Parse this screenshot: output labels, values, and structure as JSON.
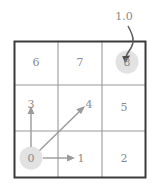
{
  "figure": {
    "type": "gridworld-policy-diagram",
    "grid": {
      "rows": 3,
      "cols": 3,
      "border_color": "#3a3a3a",
      "line_color": "#9a9a9a",
      "text_color": "#8a8a8a"
    },
    "cells": [
      {
        "id": "cell-6",
        "label": "6",
        "row": 0,
        "col": 0,
        "highlight": false
      },
      {
        "id": "cell-7",
        "label": "7",
        "row": 0,
        "col": 1,
        "highlight": false
      },
      {
        "id": "cell-8",
        "label": "8",
        "row": 0,
        "col": 2,
        "highlight": true
      },
      {
        "id": "cell-3",
        "label": "3",
        "row": 1,
        "col": 0,
        "highlight": false
      },
      {
        "id": "cell-4",
        "label": "4",
        "row": 1,
        "col": 1,
        "highlight": false
      },
      {
        "id": "cell-5",
        "label": "5",
        "row": 1,
        "col": 2,
        "highlight": false
      },
      {
        "id": "cell-0",
        "label": "0",
        "row": 2,
        "col": 0,
        "highlight": true
      },
      {
        "id": "cell-1",
        "label": "1",
        "row": 2,
        "col": 1,
        "highlight": false
      },
      {
        "id": "cell-2",
        "label": "2",
        "row": 2,
        "col": 2,
        "highlight": false
      }
    ],
    "annotation": {
      "value_label": "1.0",
      "target_cell": "8",
      "arrow_color": "#5a5a5a"
    },
    "transitions": [
      {
        "from": "0",
        "to": "3",
        "direction": "up"
      },
      {
        "from": "0",
        "to": "4",
        "direction": "up-right"
      },
      {
        "from": "0",
        "to": "1",
        "direction": "right"
      }
    ],
    "highlight_color": "#e2e2e2"
  }
}
